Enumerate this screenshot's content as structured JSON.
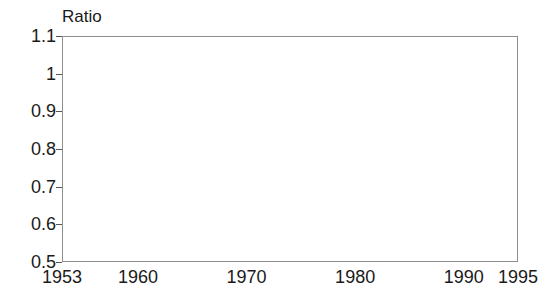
{
  "chart_data": {
    "type": "line",
    "title": "",
    "ylabel": "Ratio",
    "xlabel": "",
    "ylim": [
      0.5,
      1.1
    ],
    "xlim": [
      1953,
      1995
    ],
    "grid": "horizontal-dashed",
    "legend": "none",
    "y_ticks": [
      "1.1",
      "1",
      "0.9",
      "0.8",
      "0.7",
      "0.6",
      "0.5"
    ],
    "y_tick_values": [
      1.1,
      1.0,
      0.9,
      0.8,
      0.7,
      0.6,
      0.5
    ],
    "x_ticks": [
      "1953",
      "1960",
      "1970",
      "1980",
      "1990",
      "1995"
    ],
    "x_tick_values": [
      1953,
      1960,
      1970,
      1980,
      1990,
      1995
    ],
    "line_color": "#2b2b2b",
    "line_width": 4,
    "x": [
      1953,
      1954,
      1955,
      1956,
      1957,
      1958,
      1959,
      1960,
      1961,
      1962,
      1963,
      1964,
      1965,
      1966,
      1967,
      1968,
      1969,
      1970,
      1971,
      1972,
      1973,
      1974,
      1975,
      1976,
      1977,
      1978,
      1979,
      1980,
      1981,
      1982,
      1983,
      1984,
      1985,
      1986,
      1987,
      1988,
      1989,
      1990,
      1991,
      1992,
      1993,
      1994,
      1995
    ],
    "values": [
      0.66,
      0.645,
      0.632,
      0.617,
      0.617,
      0.613,
      0.593,
      0.598,
      0.607,
      0.615,
      0.623,
      0.642,
      0.632,
      0.645,
      0.647,
      0.667,
      0.705,
      0.733,
      0.755,
      0.762,
      0.788,
      0.803,
      0.798,
      0.833,
      0.872,
      0.875,
      0.872,
      0.845,
      0.822,
      0.872,
      0.908,
      0.942,
      0.985,
      1.057,
      1.012,
      0.957,
      0.923,
      0.925,
      0.875,
      0.925,
      0.94,
      0.985,
      0.99
    ],
    "series": [
      {
        "name": "Ratio",
        "values": [
          0.66,
          0.645,
          0.632,
          0.617,
          0.617,
          0.613,
          0.593,
          0.598,
          0.607,
          0.615,
          0.623,
          0.642,
          0.632,
          0.645,
          0.647,
          0.667,
          0.705,
          0.733,
          0.755,
          0.762,
          0.788,
          0.803,
          0.798,
          0.833,
          0.872,
          0.875,
          0.872,
          0.845,
          0.822,
          0.872,
          0.908,
          0.942,
          0.985,
          1.057,
          1.012,
          0.957,
          0.923,
          0.925,
          0.875,
          0.925,
          0.94,
          0.985,
          0.99
        ]
      }
    ]
  }
}
